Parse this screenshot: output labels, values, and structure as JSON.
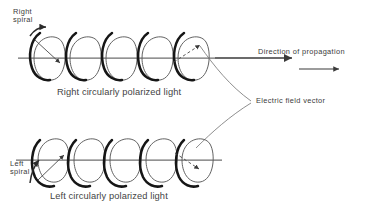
{
  "figure": {
    "title_absent": true,
    "background_color": "#ffffff",
    "ink_color": "#3a3a3a",
    "helix_stroke_dark": "#1a1a1a",
    "helix_stroke_light": "#555555",
    "axis_color": "#6e6e6e"
  },
  "labels": {
    "right_spiral": "Right\nspiral",
    "left_spiral": "Left\nspiral",
    "direction_of_propagation": "Direction of propagation",
    "electric_field_vector": "Electric field vector"
  },
  "captions": {
    "top": "Right circularly polarized light",
    "bottom": "Left circularly polarized light"
  },
  "icons": {
    "propagation_arrow": "arrow-right-icon",
    "propagation_arrow_small": "arrow-right-small-icon",
    "spiral_rotation_arrow_top": "curved-arrow-counterclockwise-icon",
    "spiral_rotation_arrow_bottom": "curved-arrow-clockwise-icon",
    "field_vector_arrow_top": "dashed-radius-arrow-icon",
    "field_vector_arrow_bottom": "dashed-radius-arrow-icon",
    "leader_line_top": "leader-line-icon",
    "leader_line_bottom": "leader-line-icon"
  },
  "diagram": {
    "top_helix": {
      "name": "right-circular-helix",
      "axis_y": 58,
      "x_start": 26,
      "x_end": 210,
      "loops": 5,
      "loop_bulge": "below-axis",
      "chirality": "right"
    },
    "bottom_helix": {
      "name": "left-circular-helix",
      "axis_y": 160,
      "x_start": 24,
      "x_end": 208,
      "loops": 5,
      "loop_bulge": "below-axis",
      "chirality": "left"
    },
    "propagation_arrow": {
      "x1": 215,
      "x2": 292,
      "y": 58
    },
    "propagation_arrow_small": {
      "x1": 298,
      "x2": 338,
      "y": 69
    }
  }
}
